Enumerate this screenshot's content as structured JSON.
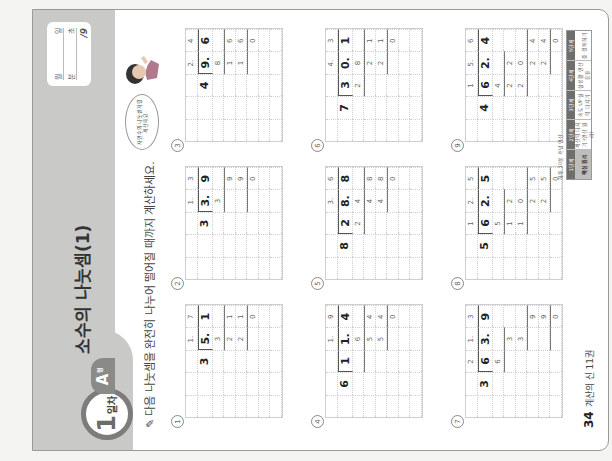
{
  "header": {
    "day_number": "1",
    "day_suffix": "일차",
    "type_label": "A",
    "type_suffix": "형",
    "title": "소수의 나눗셈(1)",
    "score_box": {
      "row1": [
        "월",
        "일"
      ],
      "row2": [
        "분",
        "초"
      ],
      "total": "/9"
    },
    "speech_bubble": "자연수의 나눗셈처럼 계산해요."
  },
  "instruction": "다음 나눗셈을 완전히 나누어 떨어질 때까지 계산하세요.",
  "problems": [
    {
      "number": "1",
      "divisor": "3",
      "dividend": "5.1",
      "quotient": "1.7",
      "steps": [
        "3",
        "21",
        "21",
        "0"
      ]
    },
    {
      "number": "2",
      "divisor": "3",
      "dividend": "3.9",
      "quotient": "1.3",
      "steps": [
        "3",
        "9",
        "9",
        "0"
      ]
    },
    {
      "number": "3",
      "divisor": "4",
      "dividend": "9.6",
      "quotient": "2.4",
      "steps": [
        "8",
        "16",
        "16",
        "0"
      ]
    },
    {
      "number": "4",
      "divisor": "6",
      "dividend": "11.4",
      "quotient": "1.9",
      "steps": [
        "6",
        "54",
        "54",
        "0"
      ]
    },
    {
      "number": "5",
      "divisor": "8",
      "dividend": "28.8",
      "quotient": "3.6",
      "steps": [
        "24",
        "48",
        "48",
        "0"
      ]
    },
    {
      "number": "6",
      "divisor": "7",
      "dividend": "30.1",
      "quotient": "4.3",
      "steps": [
        "28",
        "21",
        "21",
        "0"
      ]
    },
    {
      "number": "7",
      "divisor": "3",
      "dividend": "63.9",
      "quotient": "21.3",
      "steps": [
        "6",
        "3",
        "3",
        "9",
        "9",
        "0"
      ]
    },
    {
      "number": "8",
      "divisor": "5",
      "dividend": "62.5",
      "quotient": "12.5",
      "steps": [
        "5",
        "12",
        "10",
        "25",
        "25",
        "0"
      ]
    },
    {
      "number": "9",
      "divisor": "4",
      "dividend": "62.4",
      "quotient": "15.6",
      "steps": [
        "4",
        "22",
        "20",
        "24",
        "24",
        "0"
      ]
    }
  ],
  "footer": {
    "page_number": "34",
    "book_title": "계산의 신 11권"
  },
  "brand": {
    "tagline": "하루 10분 개념 연산",
    "columns": [
      {
        "head": "1단계",
        "body": "핵심 원리"
      },
      {
        "head": "2단계",
        "body": "계산력 다지기 (연산 원리)"
      },
      {
        "head": "3단계",
        "body": "속도 UP 실력 다지기"
      },
      {
        "head": "4단계",
        "body": "실생활 연산 응용"
      },
      {
        "head": "5단계",
        "body": "중 정복하기"
      }
    ]
  }
}
